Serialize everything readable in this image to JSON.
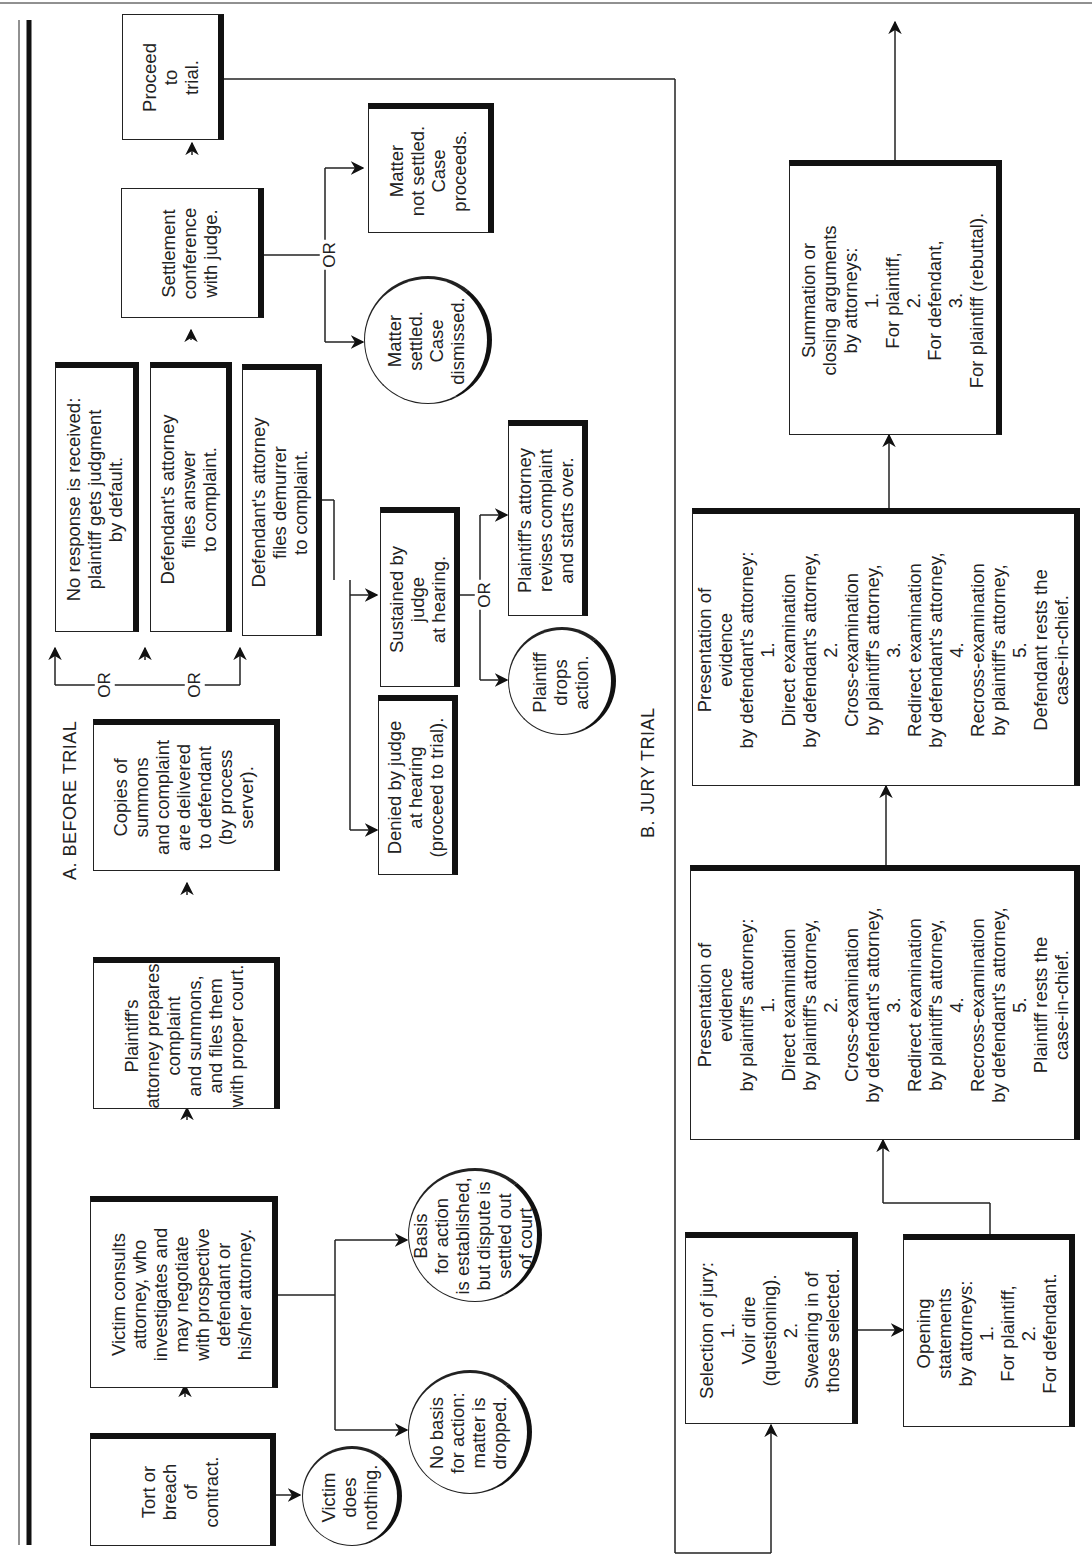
{
  "sections": {
    "before_trial": "A. BEFORE TRIAL",
    "jury_trial": "B. JURY TRIAL"
  },
  "connector_label": "OR",
  "before_trial": {
    "tort": "Tort or\nbreach\nof\ncontract.",
    "victim_does_nothing": "Victim\ndoes\nnothing.",
    "victim_consults": "Victim consults\nattorney, who\ninvestigates and\nmay negotiate\nwith prospective\ndefendant or\nhis/her attorney.",
    "no_basis": "No basis\nfor action:\nmatter is\ndropped.",
    "basis_established": "Basis\nfor action\nis established,\nbut dispute is\nsettled out\nof court.",
    "plaintiff_prepares": "Plaintiff's\nattorney prepares\ncomplaint\nand summons,\nand files them\nwith proper court.",
    "copies_delivered": "Copies of\nsummons\nand complaint\nare delivered\nto defendant\n(by process\nserver).",
    "no_response": "No response is received:\nplaintiff gets judgment\nby default.",
    "files_answer": "Defendant's attorney\nfiles answer\nto complaint.",
    "files_demurrer": "Defendant's attorney\nfiles demurrer\nto complaint.",
    "denied_by_judge": "Denied by judge\nat hearing\n(proceed to trial).",
    "sustained_by_judge": "Sustained by\njudge\nat hearing.",
    "plaintiff_drops": "Plaintiff\ndrops\naction.",
    "plaintiff_revises": "Plaintiff's attorney\nrevises complaint\nand starts over.",
    "settlement_conference": "Settlement\nconference\nwith judge.",
    "matter_settled": "Matter\nsettled.\nCase\ndismissed.",
    "matter_not_settled": "Matter\nnot settled.\nCase\nproceeds.",
    "proceed_to_trial": "Proceed\nto\ntrial."
  },
  "jury_trial": {
    "selection_of_jury": "Selection of jury:\n1.\nVoir dire\n(questioning).\n2.\nSwearing in of\nthose selected.",
    "opening_statements": "Opening\nstatements\nby attorneys:\n1.\nFor plaintiff,\n2.\nFor defendant.",
    "plaintiff_evidence": "Presentation of\nevidence\nby plaintiff's attorney:\n1.\nDirect examination\nby plaintiff's attorney,\n2.\nCross-examination\nby defendant's attorney,\n3.\nRedirect examination\nby plaintiff's attorney,\n4.\nRecross-examination\nby defendant's attorney,\n5.\nPlaintiff rests the\ncase-in-chief.",
    "defendant_evidence": "Presentation of\nevidence\nby defendant's attorney:\n1.\nDirect examination\nby defendant's attorney,\n2.\nCross-examination\nby plaintiff's attorney,\n3.\nRedirect examination\nby defendant's attorney,\n4.\nRecross-examination\nby plaintiff's attorney,\n5.\nDefendant rests the\ncase-in-chief.",
    "summation": "Summation or\nclosing arguments\nby attorneys:\n1.\nFor plaintiff,\n2.\nFor defendant,\n3.\nFor plaintiff (rebuttal)."
  }
}
